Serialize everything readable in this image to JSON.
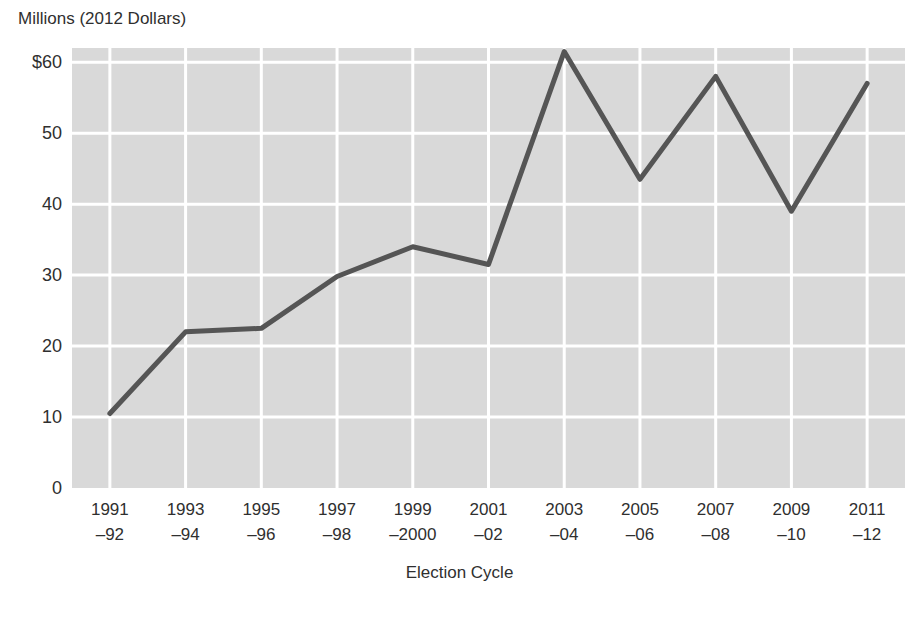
{
  "chart_data": {
    "type": "line",
    "title": "",
    "ylabel": "Millions (2012 Dollars)",
    "xlabel": "Election Cycle",
    "ylim": [
      0,
      62
    ],
    "yticks": [
      0,
      10,
      20,
      30,
      40,
      50,
      60
    ],
    "ytick_labels": [
      "0",
      "10",
      "20",
      "30",
      "40",
      "50",
      "$60"
    ],
    "grid": true,
    "legend": "none",
    "categories": [
      "1991–92",
      "1993–94",
      "1995–96",
      "1997–98",
      "1999–2000",
      "2001–02",
      "2003–04",
      "2005–06",
      "2007–08",
      "2009–10",
      "2011–12"
    ],
    "category_lines": [
      [
        "1991",
        "–92"
      ],
      [
        "1993",
        "–94"
      ],
      [
        "1995",
        "–96"
      ],
      [
        "1997",
        "–98"
      ],
      [
        "1999",
        "–2000"
      ],
      [
        "2001",
        "–02"
      ],
      [
        "2003",
        "–04"
      ],
      [
        "2005",
        "–06"
      ],
      [
        "2007",
        "–08"
      ],
      [
        "2009",
        "–10"
      ],
      [
        "2011",
        "–12"
      ]
    ],
    "values": [
      10.5,
      22.0,
      22.5,
      29.8,
      34.0,
      31.5,
      61.5,
      43.5,
      58.0,
      39.0,
      57.0
    ],
    "series_color": "#555555",
    "plot_background": "#d9d9d9",
    "gridline_color": "#ffffff",
    "text_color": "#2f2f2f",
    "page_background": "#ffffff"
  }
}
